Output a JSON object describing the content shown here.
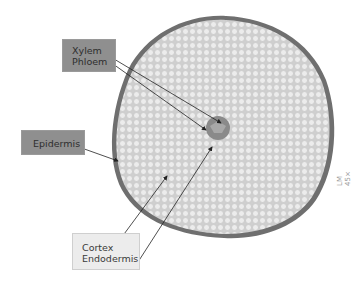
{
  "figure": {
    "magnification": "LM 45×",
    "labels": {
      "top": [
        "Xylem",
        "Phloem"
      ],
      "left": [
        "Epidermis"
      ],
      "bottom": [
        "Cortex",
        "Endodermis"
      ]
    },
    "colors": {
      "dark_label_bg": "#8f8f8f",
      "light_label_bg": "#ececec",
      "epidermis": "#6f6f6f",
      "cortex": "#d9d9d9",
      "stele": "#8a8a8a"
    }
  }
}
